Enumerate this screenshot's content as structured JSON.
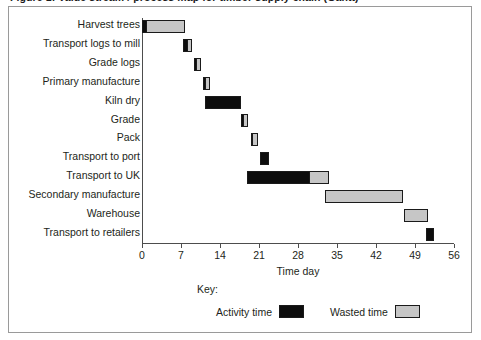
{
  "title": "Figure 1: Value stream / process map for timber supply chain (Gantt)",
  "chart_data": {
    "type": "bar",
    "subtype": "gantt",
    "title": "",
    "xlabel": "Time day",
    "ylabel": "",
    "xlim": [
      0,
      56
    ],
    "grid": false,
    "xticks": [
      0,
      7,
      14,
      21,
      28,
      35,
      42,
      49,
      56
    ],
    "xticklabels": [
      "0",
      "7",
      "14",
      "21",
      "28",
      "35",
      "42",
      "49",
      "56"
    ],
    "legend": {
      "title": "Key:",
      "position": "bottom-center",
      "entries": [
        {
          "label": "Activity time",
          "color": "#0d0d0d",
          "key": "activity"
        },
        {
          "label": "Wasted time",
          "color": "#c6c6c6",
          "key": "wasted"
        }
      ]
    },
    "categories": [
      "Harvest trees",
      "Transport logs to mill",
      "Grade logs",
      "Primary manufacture",
      "Kiln dry",
      "Grade",
      "Pack",
      "Transport to port",
      "Transport to UK",
      "Secondary manufacture",
      "Warehouse",
      "Transport to retailers"
    ],
    "tasks": [
      {
        "name": "Harvest trees",
        "start": 0.0,
        "activity": 1.0,
        "wasted": 7.0
      },
      {
        "name": "Transport logs to mill",
        "start": 7.3,
        "activity": 1.1,
        "wasted": 0.8
      },
      {
        "name": "Grade logs",
        "start": 9.4,
        "activity": 0.5,
        "wasted": 0.9
      },
      {
        "name": "Primary manufacture",
        "start": 11.0,
        "activity": 0.6,
        "wasted": 0.9
      },
      {
        "name": "Kiln dry",
        "start": 11.3,
        "activity": 6.5,
        "wasted": 0.0
      },
      {
        "name": "Grade",
        "start": 17.8,
        "activity": 0.5,
        "wasted": 1.0
      },
      {
        "name": "Pack",
        "start": 19.5,
        "activity": 0.5,
        "wasted": 1.0
      },
      {
        "name": "Transport to port",
        "start": 21.2,
        "activity": 1.6,
        "wasted": 0.0
      },
      {
        "name": "Transport to UK",
        "start": 18.8,
        "activity": 11.4,
        "wasted": 3.6
      },
      {
        "name": "Secondary manufacture",
        "start": 32.9,
        "activity": 0.0,
        "wasted": 13.9
      },
      {
        "name": "Warehouse",
        "start": 47.0,
        "activity": 0.0,
        "wasted": 4.3
      },
      {
        "name": "Transport to retailers",
        "start": 51.0,
        "activity": 1.4,
        "wasted": 0.0
      }
    ]
  }
}
